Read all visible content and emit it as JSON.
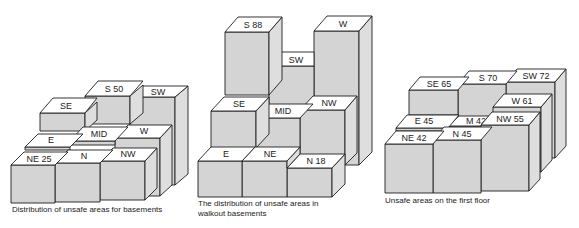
{
  "diagrams": [
    {
      "id": "basements",
      "caption": "Distribution of unsafe areas for basements",
      "blocks": [
        {
          "label": "SE"
        },
        {
          "label": "S 50"
        },
        {
          "label": "SW"
        },
        {
          "label": "E"
        },
        {
          "label": "MID"
        },
        {
          "label": "W"
        },
        {
          "label": "NE 25"
        },
        {
          "label": "N"
        },
        {
          "label": "NW"
        }
      ]
    },
    {
      "id": "walkout-basements",
      "caption_line1": "The distribution of unsafe areas in",
      "caption_line2": "walkout basements",
      "blocks": [
        {
          "label": "S 88"
        },
        {
          "label": "SW"
        },
        {
          "label": "W"
        },
        {
          "label": "SE"
        },
        {
          "label": "MID"
        },
        {
          "label": "NW"
        },
        {
          "label": "E"
        },
        {
          "label": "NE"
        },
        {
          "label": "N 18"
        }
      ]
    },
    {
      "id": "first-floor",
      "caption": "Unsafe areas on the first floor",
      "blocks": [
        {
          "label": "SE 65"
        },
        {
          "label": "S 70"
        },
        {
          "label": "SW 72"
        },
        {
          "label": "E 45"
        },
        {
          "label": "M 42"
        },
        {
          "label": "W 61"
        },
        {
          "label": "NE 42"
        },
        {
          "label": "N 45"
        },
        {
          "label": "NW 55"
        }
      ]
    }
  ]
}
